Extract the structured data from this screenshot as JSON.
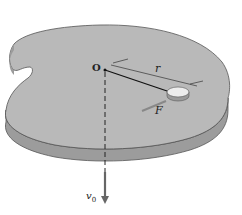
{
  "diagram": {
    "type": "physics-figure",
    "labels": {
      "origin": "O",
      "radius": "r",
      "force": "F",
      "velocity": "v",
      "velocity_sub": "0"
    },
    "colors": {
      "plate_top": "#b9b9b9",
      "plate_side": "#9c9c9c",
      "plate_edge": "#555555",
      "puck_top": "#ededed",
      "puck_side": "#9a9a9a",
      "arrow": "#666666",
      "rod": "#111111"
    }
  }
}
